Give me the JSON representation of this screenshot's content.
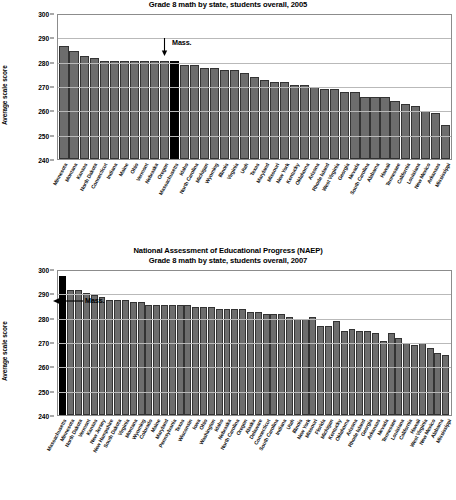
{
  "page": {
    "background": "#ffffff",
    "bar_color": "#6d6d6d",
    "highlight_color": "#000000",
    "grid_color": "#b9b9b9"
  },
  "chart_data": [
    {
      "type": "bar",
      "title_line1": "National Assessment of Educational Progress (NAEP)",
      "title_line2": "Grade 8 math by state, students overall, 2005",
      "xlabel": "",
      "ylabel": "Average scale score",
      "ylim": [
        240,
        300
      ],
      "yticks": [
        240,
        250,
        260,
        270,
        280,
        290,
        300
      ],
      "grid": true,
      "legend": "none",
      "highlight_category": "Massachusetts",
      "annotation": "Mass.",
      "categories": [
        "Minnesota",
        "Montana",
        "Kansas",
        "North Dakota",
        "Connecticut",
        "Indiana",
        "Maine",
        "Ohio",
        "Vermont",
        "Nebraska",
        "Oregon",
        "Massachusetts",
        "Idaho",
        "North Carolina",
        "Michigan",
        "Wyoming",
        "Illinois",
        "Virginia",
        "Utah",
        "Texas",
        "Maryland",
        "Missouri",
        "New York",
        "Kentucky",
        "Oklahoma",
        "Arizona",
        "Rhode Island",
        "West Virginia",
        "Georgia",
        "Nevada",
        "South Carolina",
        "Alabama",
        "Hawaii",
        "Tennessee",
        "California",
        "Louisiana",
        "New Mexico",
        "Arkansas",
        "Mississippi"
      ],
      "values": [
        290,
        286,
        284,
        283,
        282,
        282,
        282,
        282,
        281,
        284,
        281,
        281,
        281,
        282,
        277,
        282,
        278,
        284,
        279,
        281,
        278,
        276,
        280,
        274,
        271,
        274,
        272,
        269,
        272,
        270,
        281,
        262,
        266,
        271,
        269,
        268,
        263,
        272,
        262
      ],
      "values_plotted": [
        287,
        285,
        283,
        282,
        281,
        281,
        281,
        281,
        281,
        281,
        281,
        281,
        279,
        279,
        278,
        278,
        277,
        277,
        276,
        274,
        273,
        272,
        272,
        271,
        271,
        270,
        269,
        269,
        268,
        268,
        266,
        266,
        266,
        264,
        263,
        262,
        260,
        259,
        254
      ]
    },
    {
      "type": "bar",
      "title_line1": "National Assessment of Educational Progress (NAEP)",
      "title_line2": "Grade 8 math by state, students overall, 2007",
      "xlabel": "",
      "ylabel": "Average scale score",
      "ylim": [
        240,
        300
      ],
      "yticks": [
        240,
        250,
        260,
        270,
        280,
        290,
        300
      ],
      "grid": true,
      "legend": "none",
      "highlight_category": "Massachusetts",
      "annotation": "Mass.",
      "categories": [
        "Massachusetts",
        "Minnesota",
        "North Dakota",
        "Vermont",
        "Kansas",
        "New Jersey",
        "New Hampshire",
        "South Dakota",
        "Virginia",
        "Montana",
        "Wyoming",
        "Colorado",
        "Maine",
        "Maryland",
        "Pennsylvania",
        "Texas",
        "Wisconsin",
        "Iowa",
        "Ohio",
        "Washington",
        "Idaho",
        "Nebraska",
        "North Carolina",
        "Oregon",
        "Alaska",
        "Delaware",
        "Connecticut",
        "South Carolina",
        "Indiana",
        "Utah",
        "Illinois",
        "New York",
        "Missouri",
        "Florida",
        "Michigan",
        "Kentucky",
        "Oklahoma",
        "Arizona",
        "Rhode Island",
        "Georgia",
        "Arkansas",
        "Nevada",
        "Tennessee",
        "Louisiana",
        "California",
        "Hawaii",
        "West Virginia",
        "New Mexico",
        "Alabama",
        "Mississippi"
      ],
      "values_plotted": [
        298,
        292,
        292,
        291,
        290,
        289,
        288,
        288,
        288,
        287,
        287,
        286,
        286,
        286,
        286,
        286,
        286,
        285,
        285,
        285,
        284,
        284,
        284,
        284,
        283,
        283,
        282,
        282,
        282,
        281,
        280,
        280,
        281,
        277,
        277,
        279,
        275,
        276,
        275,
        275,
        274,
        271,
        274,
        272,
        270,
        269,
        270,
        268,
        266,
        265
      ]
    }
  ]
}
